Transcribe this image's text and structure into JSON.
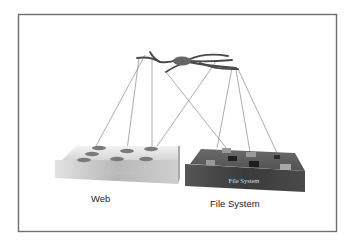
{
  "diagram": {
    "title": "",
    "nodes": [
      {
        "id": "hub",
        "label": "",
        "type": "hub",
        "shape": "ellipse"
      },
      {
        "id": "web",
        "label": "Web",
        "box_label": "Web Services",
        "type": "platform",
        "color": "#d8d8d8"
      },
      {
        "id": "fs",
        "label": "File System",
        "box_label": "File System",
        "type": "platform",
        "color": "#4f4f4f"
      }
    ],
    "edges": [
      {
        "from": "hub",
        "to": "web",
        "count": 3
      },
      {
        "from": "hub",
        "to": "fs",
        "count": 4
      },
      {
        "from": "hub",
        "to": "web-right-item",
        "count": 1
      }
    ],
    "captions": {
      "web": "Web",
      "file_system": "File System"
    },
    "box_labels": {
      "web": "Web Services",
      "file_system": "File System"
    },
    "colors": {
      "frame": "#6e6e6e",
      "wires": "#8a8a8a",
      "hub": "#6a6a6a",
      "web_box_top": "#e6e6e6",
      "web_box_front": "#bdbdbd",
      "fs_box_top": "#5a5a5a",
      "fs_box_front": "#3d3d3d"
    }
  }
}
